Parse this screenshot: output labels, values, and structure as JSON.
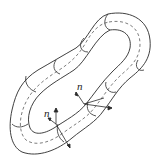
{
  "diagram": {
    "type": "tube-loop-with-normals",
    "labels": [
      {
        "id": "normal-upper",
        "text": "n"
      },
      {
        "id": "normal-lower",
        "text": "n"
      }
    ],
    "stroke_color": "#2a2a2a",
    "background": "#ffffff"
  }
}
